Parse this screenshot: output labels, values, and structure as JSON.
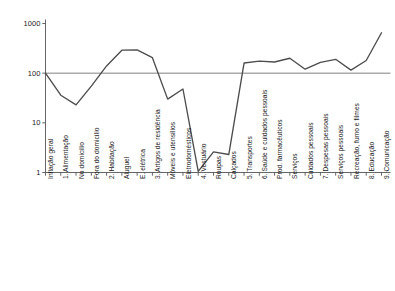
{
  "chart_data": {
    "type": "line",
    "title": "",
    "subtitle": "",
    "xlabel": "",
    "ylabel": "",
    "yscale": "log",
    "ylim": [
      1,
      1000
    ],
    "ytick_labels": [
      "1000",
      "100",
      "10",
      "1"
    ],
    "ytick_values": [
      1000,
      100,
      10,
      1
    ],
    "grid": "single horizontal reference line at 100",
    "reference_line": 100,
    "legend": "none",
    "line_color": "#4d4d4d",
    "gridline_color": "#808080",
    "axis_color": "#555555",
    "categories": [
      "Inflação geral",
      "1. Alimentação",
      "No domicílio",
      "Fora do domicílio",
      "2. Habitação",
      "Aluguel",
      "E. elétrica",
      "3. Artigos de residência",
      "Móveis e utensílios",
      "Eletrodomésticos",
      "4. Vestuário",
      "Roupas",
      "Calçados",
      "5. Transportes",
      "6. Saúde e cuidados pessoais",
      "Prod. farmacêuticos",
      "Serviços",
      "Cuidados pessoais",
      "7. Despesas pessoais",
      "Serviços pessoais",
      "Recreação, fumo e filmes",
      "8. Educação",
      "9. Comunicação"
    ],
    "values": [
      100,
      36,
      23,
      55,
      140,
      290,
      295,
      205,
      30,
      48,
      1.05,
      2.6,
      2.3,
      160,
      175,
      168,
      200,
      120,
      165,
      190,
      115,
      180,
      650
    ]
  },
  "yaxis": {
    "ticks": [
      {
        "label": "1000",
        "value": 1000
      },
      {
        "label": "100",
        "value": 100
      },
      {
        "label": "10",
        "value": 10
      },
      {
        "label": "1",
        "value": 1
      }
    ]
  }
}
